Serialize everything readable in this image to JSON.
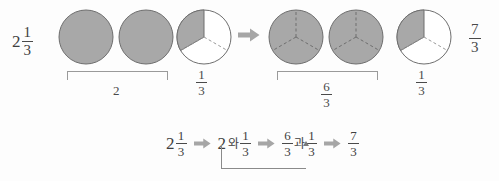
{
  "diagram": {
    "colors": {
      "shade": "#a8a8a8",
      "shade_stroke": "#6e6e6e",
      "circle_stroke": "#6e6e6e",
      "divider": "#9a9a9a",
      "arrow": "#a6a6a6",
      "text": "#3f3f3f",
      "bracket": "#9a9a9a",
      "background": "#fdfdfd"
    },
    "top_row": {
      "left_label": {
        "whole": "2",
        "numerator": "1",
        "denominator": "3"
      },
      "right_label": {
        "numerator": "7",
        "denominator": "3"
      },
      "arrow_icon": "right-block-arrow",
      "left_group": {
        "bracket_label": "2",
        "circles": [
          {
            "name": "whole-circle-1",
            "divisions": 0,
            "shaded": 1,
            "total": 1
          },
          {
            "name": "whole-circle-2",
            "divisions": 0,
            "shaded": 1,
            "total": 1
          }
        ],
        "partial_circle": {
          "name": "third-circle-left",
          "divisions": 3,
          "shaded": 1,
          "total": 3,
          "label": {
            "numerator": "1",
            "denominator": "3"
          }
        }
      },
      "right_group": {
        "bracket_label": {
          "numerator": "6",
          "denominator": "3"
        },
        "circles": [
          {
            "name": "thirds-circle-1",
            "divisions": 3,
            "shaded": 3,
            "total": 3
          },
          {
            "name": "thirds-circle-2",
            "divisions": 3,
            "shaded": 3,
            "total": 3
          }
        ],
        "partial_circle": {
          "name": "third-circle-right",
          "divisions": 3,
          "shaded": 1,
          "total": 3,
          "label": {
            "numerator": "1",
            "denominator": "3"
          }
        }
      }
    },
    "bottom_row": {
      "step1": {
        "whole": "2",
        "numerator": "1",
        "denominator": "3"
      },
      "arrow1": "right-block-arrow",
      "step2": {
        "whole": "2",
        "conjunction": "와",
        "numerator": "1",
        "denominator": "3"
      },
      "arrow2": "right-block-arrow",
      "step3": {
        "numerator": "6",
        "denominator": "3",
        "conjunction": "과",
        "numerator2": "1",
        "denominator2": "3"
      },
      "arrow3": "right-block-arrow",
      "step4": {
        "numerator": "7",
        "denominator": "3"
      },
      "connector": "curved-pointer-from-2-to-6-over-3"
    }
  }
}
